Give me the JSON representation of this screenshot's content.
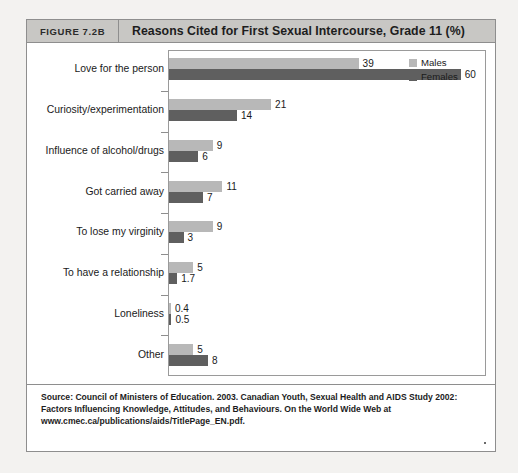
{
  "figure": {
    "tag": "FIGURE 7.2B",
    "title": "Reasons Cited for First Sexual Intercourse, Grade 11 (%)"
  },
  "legend": {
    "males_label": "Males",
    "females_label": "Females"
  },
  "source": {
    "text": "Source: Council of Ministers of Education. 2003. Canadian Youth, Sexual Health and AIDS Study 2002: Factors Influencing Knowledge, Attitudes, and Behaviours. On the World Wide Web at www.cmec.ca/publications/aids/TitlePage_EN.pdf."
  },
  "chart_data": {
    "type": "bar",
    "orientation": "horizontal",
    "title": "Reasons Cited for First Sexual Intercourse, Grade 11 (%)",
    "xlabel": "",
    "ylabel": "",
    "xlim": [
      0,
      65
    ],
    "grid": false,
    "legend_position": "top-right",
    "categories": [
      "Love for the person",
      "Curiosity/experimentation",
      "Influence of alcohol/drugs",
      "Got carried away",
      "To lose my virginity",
      "To have a relationship",
      "Loneliness",
      "Other"
    ],
    "series": [
      {
        "name": "Males",
        "color": "#b8b8b8",
        "values": [
          39,
          21,
          9,
          11,
          9,
          5,
          0.4,
          5
        ],
        "labels": [
          "39",
          "21",
          "9",
          "11",
          "9",
          "5",
          "0.4",
          "5"
        ]
      },
      {
        "name": "Females",
        "color": "#5f5f5f",
        "values": [
          60,
          14,
          6,
          7,
          3,
          1.7,
          0.5,
          8
        ],
        "labels": [
          "60",
          "14",
          "6",
          "7",
          "3",
          "1.7",
          "0.5",
          "8"
        ]
      }
    ]
  }
}
